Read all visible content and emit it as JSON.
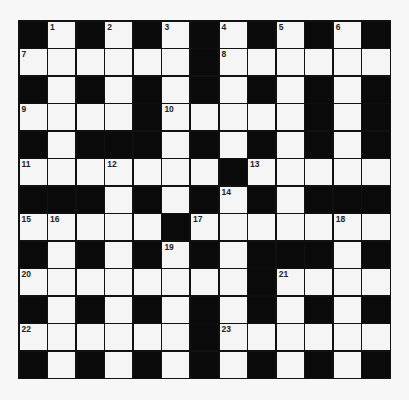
{
  "puzzle": {
    "rows": 13,
    "cols": 13,
    "colors": {
      "block": "#0a0a0a",
      "cell": "#f5f5f5",
      "border": "#111111",
      "background": "#f7f7f7"
    },
    "grid": [
      "#.#.#.#.#.#.#",
      "......#......",
      "#.#.#.#.#.#.#",
      "....#.....#.#",
      "#.###.#.#.#.#",
      ".......#.....",
      "###.#.#.#.###",
      ".....#.......",
      "#.#.#.#.###.#",
      "........#....",
      "#.#.#.#.#.#.#",
      "......#......",
      "#.#.#.#.#.#.#"
    ],
    "numbers": [
      {
        "row": 0,
        "col": 1,
        "n": "1"
      },
      {
        "row": 0,
        "col": 3,
        "n": "2"
      },
      {
        "row": 0,
        "col": 5,
        "n": "3"
      },
      {
        "row": 0,
        "col": 7,
        "n": "4"
      },
      {
        "row": 0,
        "col": 9,
        "n": "5"
      },
      {
        "row": 0,
        "col": 11,
        "n": "6"
      },
      {
        "row": 1,
        "col": 0,
        "n": "7"
      },
      {
        "row": 1,
        "col": 7,
        "n": "8"
      },
      {
        "row": 3,
        "col": 0,
        "n": "9"
      },
      {
        "row": 3,
        "col": 5,
        "n": "10"
      },
      {
        "row": 5,
        "col": 0,
        "n": "11"
      },
      {
        "row": 5,
        "col": 3,
        "n": "12"
      },
      {
        "row": 5,
        "col": 8,
        "n": "13"
      },
      {
        "row": 6,
        "col": 7,
        "n": "14"
      },
      {
        "row": 7,
        "col": 0,
        "n": "15"
      },
      {
        "row": 7,
        "col": 1,
        "n": "16"
      },
      {
        "row": 7,
        "col": 6,
        "n": "17"
      },
      {
        "row": 7,
        "col": 11,
        "n": "18"
      },
      {
        "row": 8,
        "col": 5,
        "n": "19"
      },
      {
        "row": 9,
        "col": 0,
        "n": "20"
      },
      {
        "row": 9,
        "col": 9,
        "n": "21"
      },
      {
        "row": 11,
        "col": 0,
        "n": "22"
      },
      {
        "row": 11,
        "col": 7,
        "n": "23"
      }
    ]
  }
}
